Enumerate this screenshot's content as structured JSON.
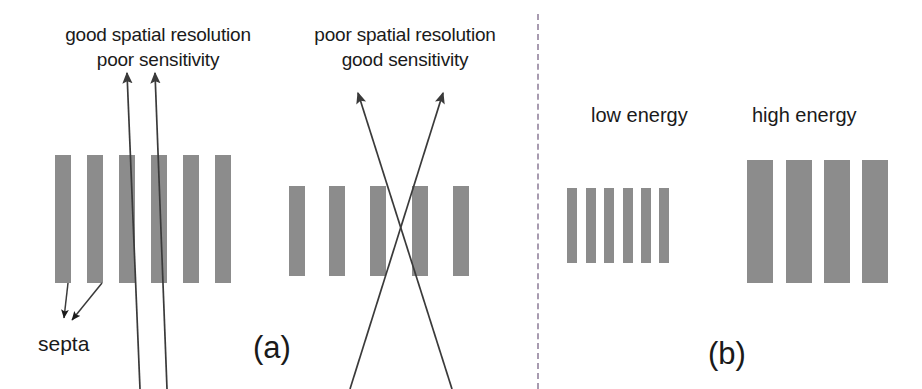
{
  "figure": {
    "width": 922,
    "height": 389,
    "background": "#ffffff",
    "bar_color": "#8c8c8c",
    "line_color": "#3a3a3a",
    "divider_color": "#a89bb0",
    "text_color": "#1a1a1a"
  },
  "panel_a": {
    "letter": "(a)",
    "left_caption": "good spatial resolution\npoor sensitivity",
    "right_caption": "poor spatial resolution\ngood sensitivity",
    "septa_label": "septa",
    "left_collimator": {
      "bar_count": 6,
      "bar_width": 16,
      "bar_height": 128,
      "bar_top": 155,
      "bar_lefts": [
        55,
        87,
        119,
        151,
        183,
        215
      ]
    },
    "right_collimator": {
      "bar_count": 5,
      "bar_width": 16,
      "bar_height": 90,
      "bar_top": 186,
      "bar_lefts": [
        289,
        329,
        370,
        412,
        453
      ]
    },
    "rays_left": [
      {
        "x1": 140,
        "y1": 389,
        "x2": 127,
        "y2": 73
      },
      {
        "x1": 167,
        "y1": 389,
        "x2": 155,
        "y2": 73
      }
    ],
    "rays_right": [
      {
        "x1": 452,
        "y1": 389,
        "x2": 358,
        "y2": 93
      },
      {
        "x1": 350,
        "y1": 389,
        "x2": 443,
        "y2": 93
      }
    ],
    "septa_arrows": [
      {
        "x1": 68,
        "y1": 283,
        "x2": 64,
        "y2": 318
      },
      {
        "x1": 102,
        "y1": 283,
        "x2": 72,
        "y2": 320
      }
    ]
  },
  "divider": {
    "x": 537,
    "y_top": 14,
    "y_bottom": 389,
    "style": "dashed-vertical"
  },
  "panel_b": {
    "letter": "(b)",
    "low_energy_label": "low energy",
    "high_energy_label": "high energy",
    "low_energy_collimator": {
      "bar_count": 6,
      "bar_width": 10,
      "bar_height": 75,
      "bar_top": 188,
      "bar_lefts": [
        567,
        586,
        604,
        623,
        641,
        659
      ]
    },
    "high_energy_collimator": {
      "bar_count": 4,
      "bar_width": 26,
      "bar_height": 123,
      "bar_top": 160,
      "bar_lefts": [
        747,
        786,
        824,
        862
      ]
    }
  },
  "labels": {
    "caption_a_left_x": 48,
    "caption_a_left_y": 22,
    "caption_a_right_x": 300,
    "caption_a_right_y": 22,
    "letter_a_x": 253,
    "letter_a_y": 332,
    "letter_b_x": 708,
    "letter_b_y": 338,
    "low_energy_x": 591,
    "low_energy_y": 105,
    "high_energy_x": 752,
    "high_energy_y": 105
  }
}
